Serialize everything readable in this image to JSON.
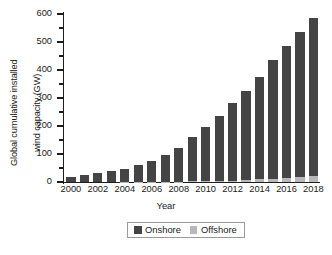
{
  "chart_data": {
    "type": "bar",
    "stacked": true,
    "title": "",
    "xlabel": "Year",
    "ylabel": "Global cumulative installed wind capacity (GW)",
    "ylabel_line1": "Global cumulative installed",
    "ylabel_line2": "wind capacity (GW)",
    "ylim": [
      0,
      600
    ],
    "yticks": [
      0,
      100,
      200,
      300,
      400,
      500,
      600
    ],
    "ytick_labels": [
      "0",
      "100",
      "200",
      "300",
      "400",
      "500",
      "600"
    ],
    "yminor_ticks": [
      50,
      150,
      250,
      350,
      450,
      550
    ],
    "grid": false,
    "legend_position": "below-axes",
    "categories": [
      2000,
      2001,
      2002,
      2003,
      2004,
      2005,
      2006,
      2007,
      2008,
      2009,
      2010,
      2011,
      2012,
      2013,
      2014,
      2015,
      2016,
      2017,
      2018
    ],
    "xtick_labels": [
      "2000",
      "2002",
      "2004",
      "2006",
      "2008",
      "2010",
      "2012",
      "2014",
      "2016",
      "2018"
    ],
    "series": [
      {
        "name": "Onshore",
        "color": "#444444",
        "values": [
          17,
          24,
          31,
          39,
          47,
          59,
          74,
          94,
          120,
          158,
          194,
          233,
          278,
          317,
          366,
          425,
          473,
          517,
          562
        ]
      },
      {
        "name": "Offshore",
        "color": "#b8b8b8",
        "values": [
          0,
          0,
          0,
          0,
          1,
          1,
          1,
          1,
          1,
          2,
          3,
          4,
          5,
          7,
          9,
          12,
          14,
          19,
          23
        ]
      }
    ],
    "totals": [
      17,
      24,
      31,
      39,
      48,
      60,
      75,
      95,
      121,
      160,
      197,
      237,
      283,
      324,
      375,
      437,
      487,
      536,
      585
    ]
  },
  "legend": {
    "items": [
      {
        "label": "Onshore",
        "color": "#444444",
        "swatch": "square-swatch"
      },
      {
        "label": "Offshore",
        "color": "#b8b8b8",
        "swatch": "square-swatch"
      }
    ]
  },
  "axes": {
    "x_title": "Year",
    "y_title_line1": "Global cumulative installed",
    "y_title_line2": "wind capacity (GW)"
  },
  "colors": {
    "onshore": "#444444",
    "offshore": "#b8b8b8",
    "axis": "#1d1d1d",
    "background": "#ffffff",
    "legend_border": "#9a9a9a"
  }
}
